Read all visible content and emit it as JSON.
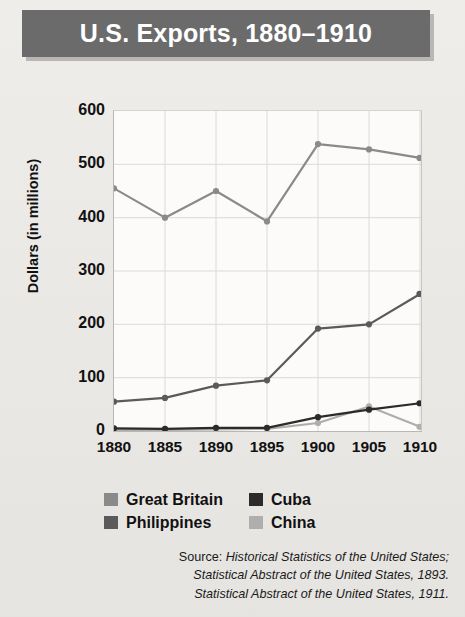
{
  "header": {
    "title": "U.S. Exports, 1880–1910",
    "bar_color": "#6b6b6b"
  },
  "legend": {
    "position": "below-axis",
    "entries": [
      {
        "label": "Great Britain",
        "color": "#8a8a8a",
        "swatch": "legend-swatch-great-britain"
      },
      {
        "label": "Cuba",
        "color": "#2b2b2b",
        "swatch": "legend-swatch-cuba"
      },
      {
        "label": "Philippines",
        "color": "#5a5a5a",
        "swatch": "legend-swatch-philippines"
      },
      {
        "label": "China",
        "color": "#aeaeae",
        "swatch": "legend-swatch-china"
      }
    ]
  },
  "source": {
    "line1_prefix": "Source: ",
    "line1_italic": "Historical Statistics of the United States;",
    "line2_italic": "Statistical Abstract of the United States, 1893.",
    "line3_italic": "Statistical Abstract of the United States, 1911."
  },
  "chart_data": {
    "type": "line",
    "title": "U.S. Exports, 1880–1910",
    "xlabel": "",
    "ylabel": "Dollars (in millions)",
    "categories": [
      "1880",
      "1885",
      "1890",
      "1895",
      "1900",
      "1905",
      "1910"
    ],
    "x": [
      1880,
      1885,
      1890,
      1895,
      1900,
      1905,
      1910
    ],
    "xlim": [
      1880,
      1910
    ],
    "ylim": [
      0,
      600
    ],
    "yticks": [
      0,
      100,
      200,
      300,
      400,
      500,
      600
    ],
    "xticks": [
      1880,
      1885,
      1890,
      1895,
      1900,
      1905,
      1910
    ],
    "grid": true,
    "markers": true,
    "series": [
      {
        "name": "Great Britain",
        "color": "#8a8a8a",
        "values": [
          455,
          400,
          450,
          393,
          538,
          528,
          512
        ]
      },
      {
        "name": "Philippines",
        "color": "#5a5a5a",
        "values": [
          55,
          62,
          85,
          95,
          192,
          200,
          257
        ]
      },
      {
        "name": "Cuba",
        "color": "#2b2b2b",
        "values": [
          5,
          4,
          6,
          6,
          26,
          40,
          52
        ]
      },
      {
        "name": "China",
        "color": "#aeaeae",
        "values": [
          2,
          2,
          3,
          4,
          15,
          46,
          8
        ]
      }
    ]
  }
}
